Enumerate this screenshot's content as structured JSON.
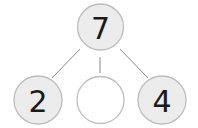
{
  "diagram": {
    "type": "number-bond",
    "whole": {
      "value": "7"
    },
    "parts": [
      {
        "value": "2"
      },
      {
        "value": ""
      },
      {
        "value": "4"
      }
    ],
    "colors": {
      "filled_circle": "#ececec",
      "empty_circle": "#ffffff",
      "stroke": "#bdbdbd",
      "line": "#8a8a8a",
      "text": "#1a1a1a"
    }
  }
}
